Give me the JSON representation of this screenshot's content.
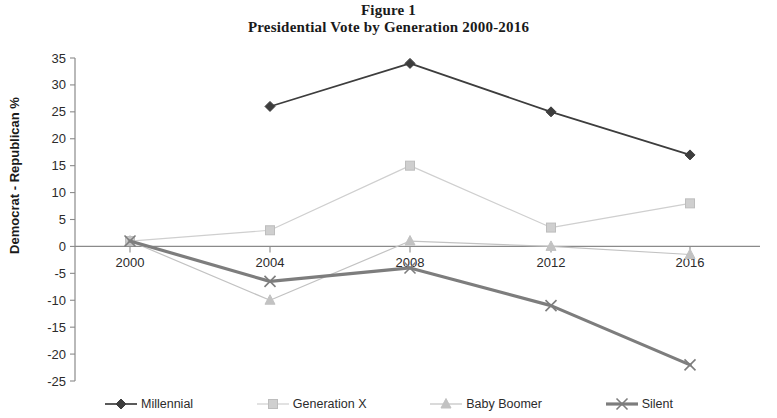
{
  "title": {
    "line1": "Figure 1",
    "line2": "Presidential Vote by Generation 2000-2016"
  },
  "axes": {
    "ylabel": "Democrat - Republican %"
  },
  "chart_data": {
    "type": "line",
    "title": "Presidential Vote by Generation 2000-2016",
    "figure_label": "Figure 1",
    "xlabel": "",
    "ylabel": "Democrat - Republican %",
    "x": [
      2000,
      2004,
      2008,
      2012,
      2016
    ],
    "xtick_labels": [
      "2000",
      "2004",
      "2008",
      "2012",
      "2016"
    ],
    "ytick_labels": [
      "35",
      "30",
      "25",
      "20",
      "15",
      "10",
      "5",
      "0",
      "-5",
      "-10",
      "-15",
      "-20",
      "-25"
    ],
    "ytick_values": [
      35,
      30,
      25,
      20,
      15,
      10,
      5,
      0,
      -5,
      -10,
      -15,
      -20,
      -25
    ],
    "ylim": [
      -25,
      35
    ],
    "grid": false,
    "zero_line": true,
    "legend_position": "bottom",
    "series": [
      {
        "name": "Millennial",
        "marker": "diamond",
        "color": "#3d3d3d",
        "x": [
          2004,
          2008,
          2012,
          2016
        ],
        "values": [
          26,
          34,
          25,
          17
        ]
      },
      {
        "name": "Generation X",
        "marker": "square",
        "color": "#cfcfcf",
        "x": [
          2000,
          2004,
          2008,
          2012,
          2016
        ],
        "values": [
          1,
          3,
          15,
          3.5,
          8
        ]
      },
      {
        "name": "Baby Boomer",
        "marker": "triangle",
        "color": "#c2c2c2",
        "x": [
          2000,
          2004,
          2008,
          2012,
          2016
        ],
        "values": [
          1,
          -10,
          1,
          0,
          -1.5
        ]
      },
      {
        "name": "Silent",
        "marker": "x",
        "color": "#7d7d7d",
        "x": [
          2000,
          2004,
          2008,
          2012,
          2016
        ],
        "values": [
          1,
          -6.5,
          -4,
          -11,
          -22
        ]
      }
    ]
  },
  "legend": [
    {
      "label": "Millennial",
      "marker": "diamond",
      "color": "#3d3d3d"
    },
    {
      "label": "Generation X",
      "marker": "square",
      "color": "#cfcfcf"
    },
    {
      "label": "Baby Boomer",
      "marker": "triangle",
      "color": "#c2c2c2"
    },
    {
      "label": "Silent",
      "marker": "x",
      "color": "#7d7d7d"
    }
  ]
}
